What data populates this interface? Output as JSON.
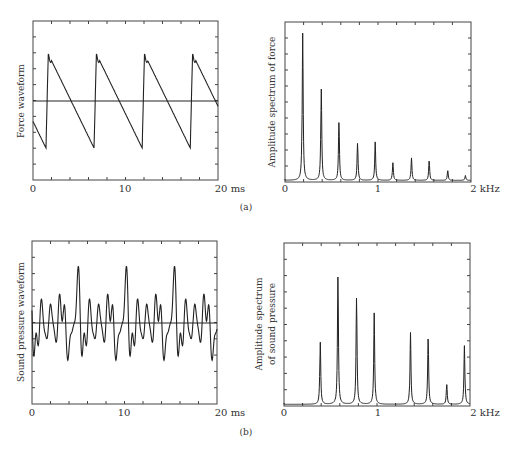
{
  "figure": {
    "panel_a_label": "(a)",
    "panel_b_label": "(b)"
  },
  "chart_data": [
    {
      "id": "force-waveform",
      "type": "line",
      "title": "",
      "ylabel": "Force waveform",
      "xlabel": "ms",
      "x_ticks": [
        "0",
        "10",
        "20 ms"
      ],
      "xlim": [
        0,
        20
      ],
      "grid": false,
      "description": "Sawtooth waveform, period ~5.2 ms, sharp rise then linear decay; horizontal zero line",
      "period_ms": 5.2,
      "rise_times_ms": [
        1.4,
        6.5,
        11.7,
        16.9
      ]
    },
    {
      "id": "force-spectrum",
      "type": "line",
      "title": "",
      "ylabel": "Amplitude spectrum of force",
      "xlabel": "kHz",
      "x_ticks": [
        "0",
        "1",
        "2 kHz"
      ],
      "xlim": [
        0,
        2
      ],
      "grid": false,
      "peaks_khz": [
        0.19,
        0.39,
        0.58,
        0.78,
        0.97,
        1.16,
        1.36,
        1.55,
        1.75,
        1.94
      ],
      "peak_heights_rel": [
        0.92,
        0.57,
        0.36,
        0.23,
        0.24,
        0.11,
        0.14,
        0.12,
        0.06,
        0.03
      ]
    },
    {
      "id": "sound-pressure-waveform",
      "type": "line",
      "title": "",
      "ylabel": "Sound pressure waveform",
      "xlabel": "ms",
      "x_ticks": [
        "0",
        "10",
        "20 ms"
      ],
      "xlim": [
        0,
        20
      ],
      "grid": false,
      "description": "Complex periodic waveform, period ~5.2 ms, around zero line"
    },
    {
      "id": "sound-pressure-spectrum",
      "type": "line",
      "title": "",
      "ylabel": "Amplitude spectrum of sound pressure",
      "xlabel": "kHz",
      "x_ticks": [
        "0",
        "1",
        "2 kHz"
      ],
      "xlim": [
        0,
        2
      ],
      "grid": false,
      "peaks_khz": [
        0.39,
        0.58,
        0.78,
        0.97,
        1.36,
        1.55,
        1.75,
        1.94
      ],
      "peak_heights_rel": [
        0.38,
        0.78,
        0.65,
        0.56,
        0.44,
        0.4,
        0.12,
        0.36
      ]
    }
  ],
  "labels": {
    "a_left_y": "Force waveform",
    "a_right_y": "Amplitude spectrum of force",
    "b_left_y": "Sound pressure waveform",
    "b_right_y_line1": "Amplitude spectrum",
    "b_right_y_line2": "of sound pressure",
    "x0": "0",
    "x10": "10",
    "x20": "20 ms",
    "k0": "0",
    "k1": "1",
    "k2": "2 kHz"
  }
}
